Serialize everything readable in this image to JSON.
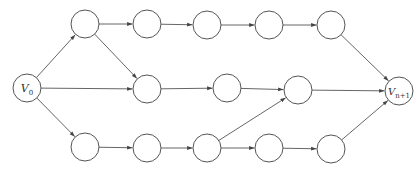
{
  "diagram": {
    "type": "directed-graph",
    "colors": {
      "stroke": "#555555",
      "background": "#ffffff",
      "text": "#333333"
    },
    "node_radius": 14,
    "nodes": [
      {
        "id": "v0",
        "label": "V",
        "subscript": "0",
        "x": 27,
        "y": 88
      },
      {
        "id": "t1",
        "label": "",
        "x": 85,
        "y": 24
      },
      {
        "id": "t2",
        "label": "",
        "x": 147,
        "y": 24
      },
      {
        "id": "t3",
        "label": "",
        "x": 207,
        "y": 25
      },
      {
        "id": "t4",
        "label": "",
        "x": 269,
        "y": 25
      },
      {
        "id": "t5",
        "label": "",
        "x": 331,
        "y": 25
      },
      {
        "id": "m1",
        "label": "",
        "x": 147,
        "y": 89
      },
      {
        "id": "m2",
        "label": "",
        "x": 227,
        "y": 88
      },
      {
        "id": "m3",
        "label": "",
        "x": 298,
        "y": 90
      },
      {
        "id": "b1",
        "label": "",
        "x": 85,
        "y": 147
      },
      {
        "id": "b2",
        "label": "",
        "x": 147,
        "y": 148
      },
      {
        "id": "b3",
        "label": "",
        "x": 207,
        "y": 148
      },
      {
        "id": "b4",
        "label": "",
        "x": 269,
        "y": 148
      },
      {
        "id": "b5",
        "label": "",
        "x": 331,
        "y": 149
      },
      {
        "id": "vn1",
        "label": "V",
        "subscript": "n+1",
        "x": 399,
        "y": 91
      }
    ],
    "edges": [
      [
        "v0",
        "t1"
      ],
      [
        "v0",
        "m1"
      ],
      [
        "v0",
        "b1"
      ],
      [
        "t1",
        "t2"
      ],
      [
        "t1",
        "m1"
      ],
      [
        "t2",
        "t3"
      ],
      [
        "t3",
        "t4"
      ],
      [
        "t4",
        "t5"
      ],
      [
        "t5",
        "vn1"
      ],
      [
        "m1",
        "m2"
      ],
      [
        "m2",
        "m3"
      ],
      [
        "m3",
        "vn1"
      ],
      [
        "b1",
        "b2"
      ],
      [
        "b2",
        "b3"
      ],
      [
        "b3",
        "m3"
      ],
      [
        "b3",
        "b4"
      ],
      [
        "b4",
        "b5"
      ],
      [
        "b5",
        "vn1"
      ]
    ]
  }
}
